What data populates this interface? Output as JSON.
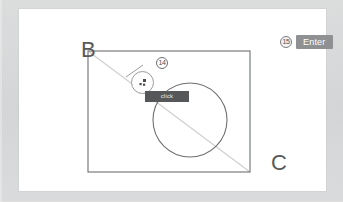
{
  "canvas": {
    "shapes": {
      "rectangle": {
        "x": 88,
        "y": 51,
        "width": 162,
        "height": 121,
        "stroke": "#6e6f71"
      },
      "circle": {
        "cx": 190,
        "cy": 120,
        "r": 37,
        "stroke": "#6e6f71"
      },
      "diagonal": {
        "x1": 88,
        "y1": 51,
        "x2": 250,
        "y2": 172,
        "stroke": "#cfd0d1"
      }
    },
    "labels": {
      "b": "B",
      "c": "C"
    }
  },
  "cursor": {
    "icon": "pointer-icon",
    "tooltip": "click"
  },
  "steps": [
    {
      "number": "14",
      "name": "step-badge-14"
    },
    {
      "number": "15",
      "name": "step-badge-15"
    }
  ],
  "key_hint": {
    "label": "Enter"
  },
  "colors": {
    "matte": "#d9dadb",
    "card": "#ffffff",
    "stroke": "#6e6f71",
    "diagonal": "#cfd0d1",
    "tooltip_bg": "#555759",
    "key_bg": "#8e9092",
    "label_text": "#58595b"
  }
}
